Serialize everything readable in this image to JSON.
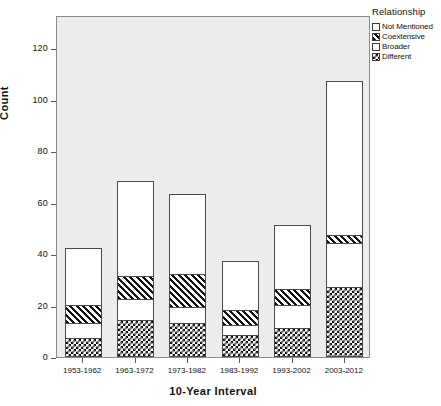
{
  "chart_data": {
    "type": "bar",
    "subtype": "stacked-bar",
    "title": "",
    "xlabel": "10-Year Interval",
    "ylabel": "Count",
    "categories": [
      "1953-1962",
      "1963-1972",
      "1973-1982",
      "1983-1992",
      "1993-2002",
      "2003-2012"
    ],
    "ylim": [
      0,
      133
    ],
    "yticks": [
      0,
      20,
      40,
      60,
      80,
      100,
      120
    ],
    "ytick_labels": [
      "0",
      "20",
      "40",
      "60",
      "80",
      "100",
      "120"
    ],
    "grid": false,
    "legend_title": "Relationship",
    "legend_position": "right-top",
    "stack_order_bottom_to_top": [
      "Different",
      "Broader",
      "Coextensive",
      "Not Mentioned"
    ],
    "series": [
      {
        "name": "Different",
        "pattern": "checkerboard",
        "values": [
          7,
          14,
          13,
          8,
          11,
          27
        ]
      },
      {
        "name": "Broader",
        "pattern": "dotted",
        "values": [
          6,
          8,
          6,
          4,
          9,
          17
        ]
      },
      {
        "name": "Coextensive",
        "pattern": "diagonal",
        "values": [
          7,
          9,
          13,
          6,
          6,
          3
        ]
      },
      {
        "name": "Not Mentioned",
        "pattern": "solid-white",
        "values": [
          22,
          37,
          31,
          19,
          25,
          60
        ]
      }
    ],
    "totals": [
      42,
      68,
      63,
      37,
      51,
      107
    ],
    "cumulative_tops": [
      {
        "category": "1953-1962",
        "different": 7,
        "broader": 13,
        "coextensive": 20,
        "not_mentioned": 42
      },
      {
        "category": "1963-1972",
        "different": 14,
        "broader": 22,
        "coextensive": 31,
        "not_mentioned": 68
      },
      {
        "category": "1973-1982",
        "different": 13,
        "broader": 19,
        "coextensive": 32,
        "not_mentioned": 63
      },
      {
        "category": "1983-1992",
        "different": 8,
        "broader": 12,
        "coextensive": 18,
        "not_mentioned": 37
      },
      {
        "category": "1993-2002",
        "different": 11,
        "broader": 20,
        "coextensive": 26,
        "not_mentioned": 51
      },
      {
        "category": "2003-2012",
        "different": 27,
        "broader": 44,
        "coextensive": 47,
        "not_mentioned": 107
      }
    ],
    "colors": {
      "plot_background": "#ececec",
      "page_background": "#ffffff",
      "frame": "#8b8b8b",
      "bar_outline": "#4a4a4a",
      "text": "#111111"
    }
  },
  "axes": {
    "y": {
      "label": "Count",
      "ticks": [
        "0",
        "20",
        "40",
        "60",
        "80",
        "100",
        "120"
      ]
    },
    "x": {
      "label": "10-Year Interval",
      "ticks": [
        "1953-1962",
        "1963-1972",
        "1973-1982",
        "1983-1992",
        "1993-2002",
        "2003-2012"
      ]
    }
  },
  "legend": {
    "title": "Relationship",
    "items": [
      {
        "label": "Not Mentioned",
        "pattern": "solid-white"
      },
      {
        "label": "Coextensive",
        "pattern": "diagonal"
      },
      {
        "label": "Broader",
        "pattern": "dotted"
      },
      {
        "label": "Different",
        "pattern": "checkerboard"
      }
    ]
  }
}
